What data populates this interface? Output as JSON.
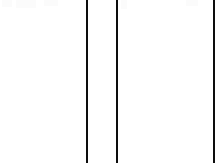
{
  "page": {
    "title": "Cropped document fragment",
    "width": 223,
    "height": 168,
    "background_color": "#ffffff"
  },
  "rules": {
    "color": "#0d0d0d",
    "items": [
      {
        "name": "left-column-rule",
        "x": 86,
        "width": 2,
        "top": 0,
        "height": 163
      },
      {
        "name": "middle-column-rule",
        "x": 116,
        "width": 2,
        "top": 0,
        "height": 163
      },
      {
        "name": "right-column-rule",
        "x": 213,
        "width": 2,
        "top": 0,
        "height": 163
      }
    ]
  },
  "artifacts": {
    "color": "#fbfbfb",
    "items": [
      {
        "name": "top-edge-artifact-a",
        "x": 2,
        "y": 0,
        "width": 10,
        "height": 7
      },
      {
        "name": "top-edge-artifact-b",
        "x": 16,
        "y": 0,
        "width": 20,
        "height": 8
      },
      {
        "name": "top-edge-artifact-c",
        "x": 44,
        "y": 0,
        "width": 14,
        "height": 6
      },
      {
        "name": "top-edge-artifact-d",
        "x": 121,
        "y": 0,
        "width": 6,
        "height": 9
      },
      {
        "name": "top-edge-artifact-e",
        "x": 186,
        "y": 0,
        "width": 12,
        "height": 6
      }
    ]
  },
  "content": {
    "body_text": "",
    "note": "No legible text present in this crop"
  }
}
